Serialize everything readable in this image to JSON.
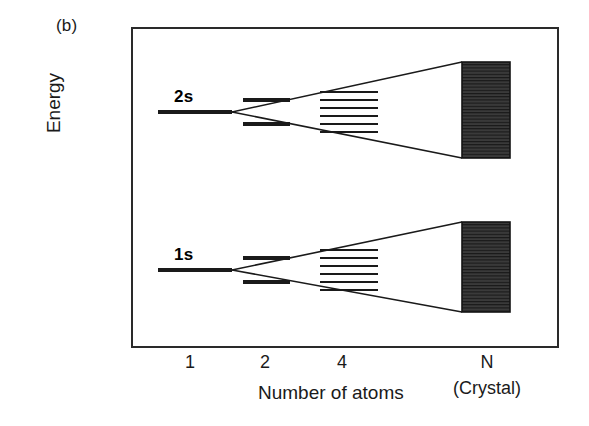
{
  "figure": {
    "panel_label": "(b)",
    "y_axis_label": "Energy",
    "x_axis_label": "Number of atoms",
    "crystal_note": "(Crystal)"
  },
  "x_ticks": [
    {
      "label": "1",
      "x": 190
    },
    {
      "label": "2",
      "x": 265
    },
    {
      "label": "4",
      "x": 342
    },
    {
      "label": "N",
      "x": 487
    }
  ],
  "orbitals": [
    {
      "name": "2s",
      "label": "2s",
      "label_x": 172,
      "label_y": 85
    },
    {
      "name": "1s",
      "label": "1s",
      "label_x": 172,
      "label_y": 243
    }
  ],
  "chart_data": {
    "type": "diagram",
    "xlabel": "Number of atoms",
    "ylabel": "Energy",
    "categories": [
      "1",
      "2",
      "4",
      "N"
    ],
    "annotations": [
      "(b)",
      "2s",
      "1s",
      "(Crystal)"
    ],
    "series": [
      {
        "name": "2s",
        "single_level_y": 112,
        "two_atom_levels_y": [
          100,
          124
        ],
        "four_atom_levels_y": [
          92,
          100,
          108,
          116,
          124,
          132
        ],
        "band_top_y": 62,
        "band_bottom_y": 158
      },
      {
        "name": "1s",
        "single_level_y": 270,
        "two_atom_levels_y": [
          258,
          282
        ],
        "four_atom_levels_y": [
          250,
          258,
          266,
          274,
          282,
          290
        ],
        "band_top_y": 222,
        "band_bottom_y": 312
      }
    ],
    "geometry": {
      "frame": {
        "x": 131,
        "y": 27,
        "width": 428,
        "height": 321
      },
      "band_x_left": 462,
      "band_x_right": 510,
      "apex_x": 232,
      "two_atom_x_start": 243,
      "two_atom_x_end": 290,
      "four_atom_x_start": 320,
      "four_atom_x_end": 378,
      "single_level_x_start": 158,
      "single_level_x_end": 232
    },
    "colors": {
      "frame": "#2a2a2a",
      "line": "#1a1a1a",
      "band_fill": "#3a3a3a",
      "text": "#1a1a1a",
      "background": "#ffffff"
    }
  }
}
